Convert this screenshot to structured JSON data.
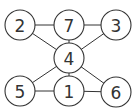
{
  "graph": {
    "nodes": [
      {
        "id": "2",
        "label": "2",
        "x": 20,
        "y": 25
      },
      {
        "id": "7",
        "label": "7",
        "x": 69,
        "y": 25
      },
      {
        "id": "3",
        "label": "3",
        "x": 116,
        "y": 25
      },
      {
        "id": "4",
        "label": "4",
        "x": 69,
        "y": 58
      },
      {
        "id": "5",
        "label": "5",
        "x": 20,
        "y": 91
      },
      {
        "id": "1",
        "label": "1",
        "x": 69,
        "y": 91
      },
      {
        "id": "6",
        "label": "6",
        "x": 116,
        "y": 92
      }
    ],
    "edges": [
      [
        "2",
        "7"
      ],
      [
        "7",
        "3"
      ],
      [
        "2",
        "4"
      ],
      [
        "7",
        "4"
      ],
      [
        "3",
        "4"
      ],
      [
        "4",
        "5"
      ],
      [
        "4",
        "1"
      ],
      [
        "4",
        "6"
      ],
      [
        "5",
        "1"
      ],
      [
        "1",
        "6"
      ]
    ],
    "node_radius": 15
  }
}
